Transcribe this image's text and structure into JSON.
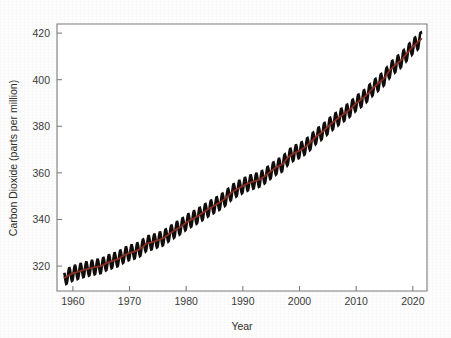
{
  "figure": {
    "background_color": "#fdfdfd",
    "frame_color": "#7d7d7d",
    "plot_area": {
      "left": 57,
      "top": 24,
      "right": 427,
      "bottom": 291
    }
  },
  "chart_data": {
    "type": "line",
    "title": "",
    "subtitle": "",
    "xlabel": "Year",
    "ylabel": "Carbon Dioxide (parts per million)",
    "xlim": [
      1957.2,
      2022.5
    ],
    "ylim": [
      309.3,
      423.9
    ],
    "xticks": [
      1960,
      1970,
      1980,
      1990,
      2000,
      2010,
      2020
    ],
    "xtick_labels": [
      "1960",
      "1970",
      "1980",
      "1990",
      "2000",
      "2010",
      "2020"
    ],
    "yticks": [
      320,
      340,
      360,
      380,
      400,
      420
    ],
    "ytick_labels": [
      "320",
      "340",
      "360",
      "380",
      "400",
      "420"
    ],
    "grid": false,
    "legend": null,
    "series": [
      {
        "name": "Monthly mean CO2 (seasonal cycle)",
        "color": "#120d0b",
        "linewidth": 2.6,
        "note": "Monthly Mauna Loa record; annual sawtooth of about 6 ppm peak-to-trough, peak in May, minimum in September",
        "seasonal_amplitude_ppm": 3.1,
        "seasonal_peak_month_fraction": 0.37,
        "x": [
          1958.5,
          1959,
          1960,
          1961,
          1962,
          1963,
          1964,
          1965,
          1966,
          1967,
          1968,
          1969,
          1970,
          1971,
          1972,
          1973,
          1974,
          1975,
          1976,
          1977,
          1978,
          1979,
          1980,
          1981,
          1982,
          1983,
          1984,
          1985,
          1986,
          1987,
          1988,
          1989,
          1990,
          1991,
          1992,
          1993,
          1994,
          1995,
          1996,
          1997,
          1998,
          1999,
          2000,
          2001,
          2002,
          2003,
          2004,
          2005,
          2006,
          2007,
          2008,
          2009,
          2010,
          2011,
          2012,
          2013,
          2014,
          2015,
          2016,
          2017,
          2018,
          2019,
          2020,
          2021,
          2021.5
        ],
        "values": [
          315.0,
          315.6,
          316.9,
          317.6,
          318.4,
          319.0,
          319.6,
          320.0,
          321.4,
          322.2,
          323.0,
          324.6,
          325.7,
          326.3,
          327.5,
          329.7,
          330.2,
          331.1,
          332.0,
          333.8,
          335.4,
          336.8,
          338.7,
          340.1,
          341.4,
          343.0,
          344.6,
          346.0,
          347.4,
          349.2,
          351.6,
          353.1,
          354.4,
          355.6,
          356.4,
          357.1,
          358.8,
          360.8,
          362.6,
          363.7,
          366.7,
          368.4,
          369.5,
          371.1,
          373.2,
          375.8,
          377.5,
          379.8,
          381.9,
          383.8,
          385.6,
          387.4,
          389.9,
          391.6,
          393.8,
          396.5,
          398.6,
          400.8,
          404.2,
          406.5,
          408.5,
          411.4,
          414.2,
          416.4,
          417.5
        ]
      },
      {
        "name": "Seasonally adjusted trend",
        "color": "#8c2f23",
        "linewidth": 1.7,
        "x": [
          1958.5,
          1959,
          1960,
          1961,
          1962,
          1963,
          1964,
          1965,
          1966,
          1967,
          1968,
          1969,
          1970,
          1971,
          1972,
          1973,
          1974,
          1975,
          1976,
          1977,
          1978,
          1979,
          1980,
          1981,
          1982,
          1983,
          1984,
          1985,
          1986,
          1987,
          1988,
          1989,
          1990,
          1991,
          1992,
          1993,
          1994,
          1995,
          1996,
          1997,
          1998,
          1999,
          2000,
          2001,
          2002,
          2003,
          2004,
          2005,
          2006,
          2007,
          2008,
          2009,
          2010,
          2011,
          2012,
          2013,
          2014,
          2015,
          2016,
          2017,
          2018,
          2019,
          2020,
          2021,
          2021.5
        ],
        "values": [
          315.0,
          315.6,
          316.9,
          317.6,
          318.4,
          319.0,
          319.6,
          320.0,
          321.4,
          322.2,
          323.0,
          324.6,
          325.7,
          326.3,
          327.5,
          329.7,
          330.2,
          331.1,
          332.0,
          333.8,
          335.4,
          336.8,
          338.7,
          340.1,
          341.4,
          343.0,
          344.6,
          346.0,
          347.4,
          349.2,
          351.6,
          353.1,
          354.4,
          355.6,
          356.4,
          357.1,
          358.8,
          360.8,
          362.6,
          363.7,
          366.7,
          368.4,
          369.5,
          371.1,
          373.2,
          375.8,
          377.5,
          379.8,
          381.9,
          383.8,
          385.6,
          387.4,
          389.9,
          391.6,
          393.8,
          396.5,
          398.6,
          400.8,
          404.2,
          406.5,
          408.5,
          411.4,
          414.2,
          416.4,
          417.5
        ]
      }
    ]
  }
}
